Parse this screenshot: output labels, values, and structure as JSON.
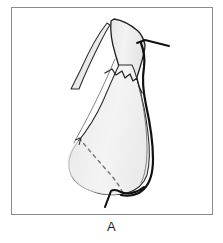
{
  "figure": {
    "caption": "A",
    "frame_color": "#8a8a8c",
    "background_color": "#ffffff",
    "ink_color": "#1b1b1b",
    "fill_light": "#f2f2f2",
    "fill_mid": "#e8e8e8",
    "fill_shadow": "#dcdcdc",
    "dashed_line_color": "#7d7d7d",
    "parts": {
      "pedicle": "upper-narrow-pedicle",
      "secondary_flap": "left-narrow-flap",
      "body": "broad-lower-flap-body",
      "serrated_edge": "jagged-mid-right-edge",
      "dashed_incision": "dashed-incision-line",
      "suture_upper": "upper-right-suture-thread",
      "suture_lower": "lower-hooked-suture-thread"
    }
  }
}
